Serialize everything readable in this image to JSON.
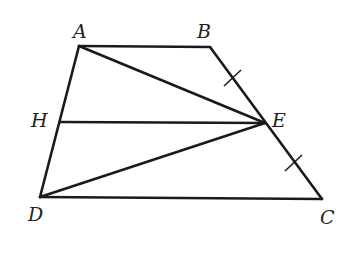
{
  "diagram": {
    "type": "geometry",
    "points": {
      "A": {
        "label": "A",
        "x": 79,
        "y": 46
      },
      "B": {
        "label": "B",
        "x": 210,
        "y": 47
      },
      "C": {
        "label": "C",
        "x": 322,
        "y": 199
      },
      "D": {
        "label": "D",
        "x": 40,
        "y": 197
      },
      "E": {
        "label": "E",
        "x": 265,
        "y": 123
      },
      "H": {
        "label": "H",
        "x": 60,
        "y": 122
      }
    },
    "segments": [
      "AB",
      "BC",
      "CD",
      "DA",
      "AE",
      "DE",
      "HE"
    ],
    "equal_marks": [
      "BE",
      "EC"
    ],
    "stroke_color": "#1a1a1a"
  }
}
